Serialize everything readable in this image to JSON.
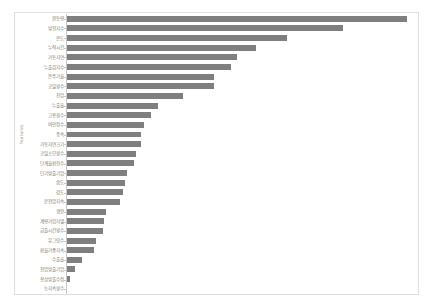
{
  "chart_title": "",
  "y_axis_title": "Features",
  "colors": {
    "bar": "#7f7f7f",
    "frame": "#dedede",
    "axis": "#c9c9c9",
    "label_text": "#7d7d7d",
    "background": "#ffffff"
  },
  "chart_data": {
    "type": "bar",
    "orientation": "horizontal",
    "title": "",
    "xlabel": "",
    "ylabel": "Features",
    "grid": false,
    "legend": false,
    "xlim": [
      0,
      100
    ],
    "categories": [
      "활동량",
      "방전지수",
      "온도",
      "누적시간",
      "가동지연",
      "누출감지수",
      "온주기율",
      "코일횟수",
      "전압",
      "누출율",
      "고용횟수",
      "비인정수",
      "풍속",
      "가동지연크기",
      "코일소모횟수",
      "단계율환전수",
      "단기방출기압",
      "습도",
      "강도",
      "분전압지속",
      "생활",
      "계량가압지열",
      "급출시간횟수",
      "유그림수",
      "환율가중지속",
      "수출율",
      "전압방출기압",
      "용상방출수정",
      "능지속횟수"
    ],
    "values": [
      98.0,
      79.5,
      63.5,
      54.5,
      49.0,
      47.5,
      42.5,
      42.5,
      33.5,
      26.5,
      24.5,
      22.5,
      21.5,
      21.5,
      20.0,
      19.5,
      17.5,
      17.0,
      16.5,
      15.5,
      11.5,
      11.0,
      10.5,
      8.5,
      8.0,
      4.5,
      2.5,
      1.2,
      0.4
    ]
  }
}
